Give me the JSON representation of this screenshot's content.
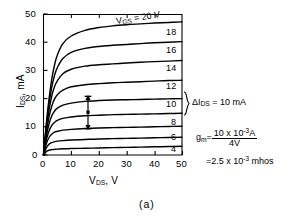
{
  "figure": {
    "caption": "(a)",
    "axes": {
      "x": {
        "title_main": "V",
        "title_sub": "DS",
        "title_unit": ", V",
        "ticks": [
          0,
          10,
          20,
          30,
          40,
          50
        ],
        "tick_labels": [
          "0",
          "10",
          "20",
          "30",
          "40",
          "50"
        ],
        "min": 0,
        "max": 50
      },
      "y": {
        "title_main": "I",
        "title_sub": "DS",
        "title_unit": ", mA",
        "ticks": [
          0,
          10,
          20,
          30,
          40,
          50
        ],
        "tick_labels": [
          "0",
          "10",
          "20",
          "30",
          "40",
          "50"
        ],
        "min": 0,
        "max": 50
      }
    },
    "top_label": {
      "main": "V",
      "sub": "GS",
      "value": " = 20 V"
    },
    "curve_labels": [
      "18",
      "16",
      "14",
      "12",
      "10",
      "8",
      "6",
      "4"
    ],
    "delta_annotation": {
      "symbol": "ΔI",
      "sub": "DS",
      "value": " = 10 mA"
    },
    "gm_equation": {
      "symbol": "g",
      "sub": "m",
      "equals": "=",
      "numerator": "10 x 10",
      "numerator_exp": "-3",
      "numerator_unit": "A",
      "denominator": "4V",
      "result_prefix": "=2.5 x 10",
      "result_exp": "-3",
      "result_unit": " mhos"
    },
    "colors": {
      "ink": "#000000",
      "background": "#ffffff"
    }
  },
  "chart_data": {
    "type": "line",
    "title": "",
    "xlabel": "V_DS, V",
    "ylabel": "I_DS, mA",
    "xlim": [
      0,
      50
    ],
    "ylim": [
      0,
      50
    ],
    "grid": false,
    "legend": "inline-right-of-each-curve",
    "x": [
      0,
      1,
      2,
      3,
      4,
      5,
      7,
      10,
      15,
      20,
      25,
      30,
      35,
      40,
      45,
      50
    ],
    "series": [
      {
        "name": "V_GS = 20 V",
        "label": "20 V",
        "values": [
          0,
          11.0,
          20.0,
          27.0,
          32.0,
          35.5,
          39.5,
          42.2,
          44.2,
          45.2,
          45.8,
          46.2,
          46.5,
          46.8,
          47.0,
          47.2
        ]
      },
      {
        "name": "V_GS = 18 V",
        "label": "18",
        "values": [
          0,
          10.0,
          18.2,
          24.2,
          28.3,
          31.0,
          34.2,
          36.4,
          37.8,
          38.5,
          38.9,
          39.2,
          39.5,
          39.8,
          40.0,
          40.2
        ]
      },
      {
        "name": "V_GS = 16 V",
        "label": "16",
        "values": [
          0,
          9.0,
          16.0,
          21.0,
          24.3,
          26.3,
          28.8,
          30.4,
          31.5,
          32.0,
          32.3,
          32.6,
          32.9,
          33.1,
          33.3,
          33.5
        ]
      },
      {
        "name": "V_GS = 14 V",
        "label": "14",
        "values": [
          0,
          7.8,
          13.5,
          17.4,
          19.9,
          21.4,
          23.0,
          24.2,
          24.9,
          25.3,
          25.6,
          25.8,
          26.0,
          26.2,
          26.4,
          26.5
        ]
      },
      {
        "name": "V_GS = 12 V",
        "label": "12",
        "values": [
          0,
          6.5,
          11.0,
          13.9,
          15.6,
          16.6,
          17.7,
          18.4,
          19.0,
          19.3,
          19.5,
          19.6,
          19.7,
          19.8,
          19.9,
          20.0
        ]
      },
      {
        "name": "V_GS = 10 V",
        "label": "10",
        "values": [
          0,
          5.2,
          8.5,
          10.5,
          11.6,
          12.3,
          13.0,
          13.5,
          13.9,
          14.1,
          14.3,
          14.4,
          14.5,
          14.6,
          14.7,
          14.8
        ]
      },
      {
        "name": "V_GS = 8 V",
        "label": "8",
        "values": [
          0,
          3.9,
          6.2,
          7.4,
          8.1,
          8.4,
          8.8,
          9.1,
          9.4,
          9.6,
          9.7,
          9.8,
          9.9,
          10.0,
          10.1,
          10.2
        ]
      },
      {
        "name": "V_GS = 6 V",
        "label": "6",
        "values": [
          0,
          2.5,
          3.8,
          4.4,
          4.7,
          4.9,
          5.1,
          5.3,
          5.5,
          5.7,
          5.8,
          5.9,
          6.0,
          6.1,
          6.2,
          6.3
        ]
      },
      {
        "name": "V_GS = 4 V",
        "label": "4",
        "values": [
          0,
          1.2,
          1.7,
          1.9,
          2.0,
          2.1,
          2.2,
          2.3,
          2.4,
          2.5,
          2.6,
          2.7,
          2.8,
          2.9,
          3.0,
          3.1
        ]
      }
    ],
    "annotations": [
      {
        "type": "double-arrow",
        "x": 16,
        "y_from": 9.4,
        "y_to": 19.1,
        "label": "ΔI_DS = 10 mA"
      },
      {
        "type": "text",
        "label": "g_m = (10 x 10^-3 A) / (4V) = 2.5 x 10^-3 mhos"
      }
    ]
  }
}
